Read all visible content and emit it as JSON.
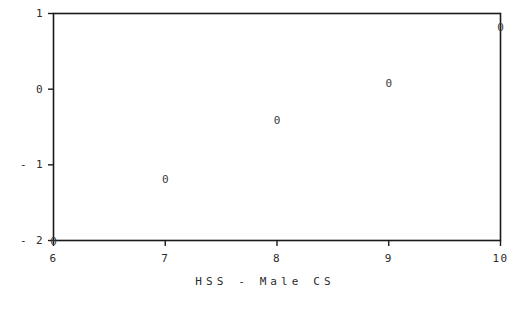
{
  "chart_data": {
    "type": "scatter",
    "title": "",
    "xlabel": "HSS - Male CS",
    "ylabel": "",
    "xlim": [
      6,
      10
    ],
    "ylim": [
      -2,
      1
    ],
    "grid": false,
    "legend": null,
    "marker_glyph": "0",
    "xticks": [
      6,
      7,
      8,
      9,
      10
    ],
    "xtick_labels": [
      "6",
      "7",
      "8",
      "9",
      "10"
    ],
    "yticks": [
      1,
      0,
      -1,
      -2
    ],
    "ytick_labels": [
      "1",
      "0",
      "- 1",
      "- 2"
    ],
    "points": [
      {
        "label": "0",
        "x": 6,
        "y": -2
      },
      {
        "label": "0",
        "x": 7,
        "y": -1.19
      },
      {
        "label": "0",
        "x": 8,
        "y": -0.41
      },
      {
        "label": "0",
        "x": 9,
        "y": 0.08
      },
      {
        "label": "0",
        "x": 10,
        "y": 0.82
      }
    ]
  },
  "style": {
    "background": "#ffffff",
    "axis_color": "#1a1a1a",
    "text_color": "#2b2b2b",
    "marker_color": "#3a3a3a"
  }
}
